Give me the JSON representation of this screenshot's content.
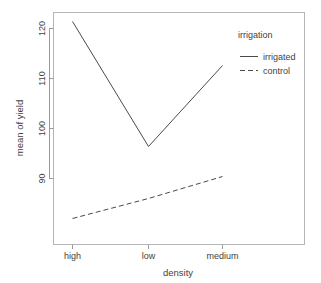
{
  "chart_data": {
    "type": "line",
    "title": "",
    "xlabel": "density",
    "ylabel": "mean of yield",
    "categories": [
      "high",
      "low",
      "medium"
    ],
    "series": [
      {
        "name": "irrigated",
        "values": [
          121.4,
          96.4,
          112.6
        ],
        "style": "solid"
      },
      {
        "name": "control",
        "values": [
          82.0,
          86.0,
          90.4
        ],
        "style": "dashed"
      }
    ],
    "ylim": [
      80.5,
      123.5
    ],
    "yticks": [
      90,
      100,
      110,
      120
    ],
    "ytick_labels": [
      "90",
      "100",
      "110",
      "120"
    ],
    "grid": false,
    "legend": {
      "title": "irrigation",
      "position": "top-right",
      "entries": [
        {
          "label": "irrigated",
          "style": "solid"
        },
        {
          "label": "control",
          "style": "dashed"
        }
      ]
    },
    "colors": {
      "line": "#4a4a4a",
      "axis": "#9a9a9a",
      "frame": "#b5b5b5",
      "text": "#3f3f3f",
      "background": "#ffffff"
    }
  }
}
